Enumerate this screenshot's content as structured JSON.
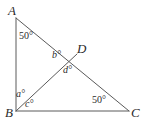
{
  "figure": {
    "type": "geometry-diagram",
    "stroke_color": "#5a5a5a",
    "label_color": "#2b2b2b",
    "background_color": "#ffffff",
    "vertices": [
      {
        "name": "A",
        "label": "A",
        "x": 16,
        "y": 18
      },
      {
        "name": "B",
        "label": "B",
        "x": 16,
        "y": 111
      },
      {
        "name": "C",
        "label": "C",
        "x": 129,
        "y": 111
      },
      {
        "name": "D",
        "label": "D",
        "x": 77,
        "y": 54
      }
    ],
    "segments": [
      {
        "name": "side-AB",
        "from": "A",
        "to": "B"
      },
      {
        "name": "side-BC",
        "from": "B",
        "to": "C"
      },
      {
        "name": "side-AC",
        "from": "A",
        "to": "C"
      },
      {
        "name": "cevian-BD",
        "from": "B",
        "to": "D"
      }
    ],
    "vertex_labels": [
      {
        "name": "vertex-label-a",
        "text": "A",
        "x": 8,
        "y": 4
      },
      {
        "name": "vertex-label-b",
        "text": "B",
        "x": 5,
        "y": 106
      },
      {
        "name": "vertex-label-c",
        "text": "C",
        "x": 131,
        "y": 106
      },
      {
        "name": "vertex-label-d",
        "text": "D",
        "x": 77,
        "y": 42
      }
    ],
    "angle_labels": [
      {
        "name": "angle-at-a",
        "text": "50°",
        "x": 19,
        "y": 31,
        "italic": false
      },
      {
        "name": "angle-b-at-d",
        "text": "b°",
        "x": 52,
        "y": 50,
        "italic": true
      },
      {
        "name": "angle-d-at-d",
        "text": "d°",
        "x": 63,
        "y": 65,
        "italic": true
      },
      {
        "name": "angle-a-at-b",
        "text": "a°",
        "x": 16,
        "y": 89,
        "italic": true
      },
      {
        "name": "angle-c-at-b",
        "text": "c°",
        "x": 25,
        "y": 99,
        "italic": true
      },
      {
        "name": "angle-at-c",
        "text": "50°",
        "x": 92,
        "y": 95,
        "italic": false
      }
    ]
  }
}
